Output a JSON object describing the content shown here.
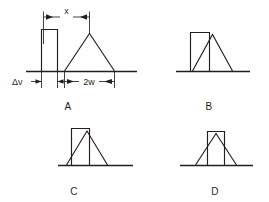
{
  "figure": {
    "background_color": "#ffffff",
    "ink_color": "#231f20",
    "panels": [
      {
        "id": "A",
        "label": "A",
        "separation_label": "x",
        "rect_width_label": "Δν",
        "triangle_width_label": "2w",
        "overlap": "none",
        "description": "Rectangle fully separated from triangle; separation x measured between rectangle right edge and triangle apex"
      },
      {
        "id": "B",
        "label": "B",
        "overlap": "slight",
        "description": "Triangle left leg begins to overlap the rectangle right portion"
      },
      {
        "id": "C",
        "label": "C",
        "overlap": "moderate",
        "description": "Triangle shifted further left; apex near rectangle right edge"
      },
      {
        "id": "D",
        "label": "D",
        "overlap": "full",
        "description": "Triangle apex centered inside the rectangle; maximum overlap"
      }
    ],
    "annotations": {
      "x_dimension": "x",
      "delta_nu_dimension": "Δν",
      "two_w_dimension": "2w"
    }
  }
}
